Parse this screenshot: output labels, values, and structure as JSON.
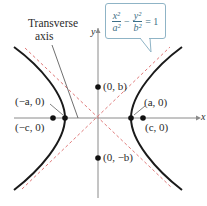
{
  "figure": {
    "type": "hyperbola-diagram",
    "equation": {
      "x_num": "x²",
      "x_den": "a²",
      "minus": "−",
      "y_num": "y²",
      "y_den": "b²",
      "equals": "= 1"
    },
    "axes": {
      "x_label": "x",
      "y_label": "y"
    },
    "annotations": {
      "transverse_line1": "Transverse",
      "transverse_line2": "axis"
    },
    "points": [
      {
        "id": "neg-a",
        "label": "(−a, 0)"
      },
      {
        "id": "neg-c",
        "label": "(−c, 0)"
      },
      {
        "id": "pos-a",
        "label": "(a, 0)"
      },
      {
        "id": "pos-c",
        "label": "(c, 0)"
      },
      {
        "id": "pos-b",
        "label": "(0, b)"
      },
      {
        "id": "neg-b",
        "label": "(0, −b)"
      }
    ],
    "colors": {
      "curve": "#1a1a1a",
      "asymptote": "#e07a7a",
      "axis": "#8a8a8a",
      "callout_border": "#8fb4c6",
      "equation_text": "#3c6f86"
    }
  }
}
